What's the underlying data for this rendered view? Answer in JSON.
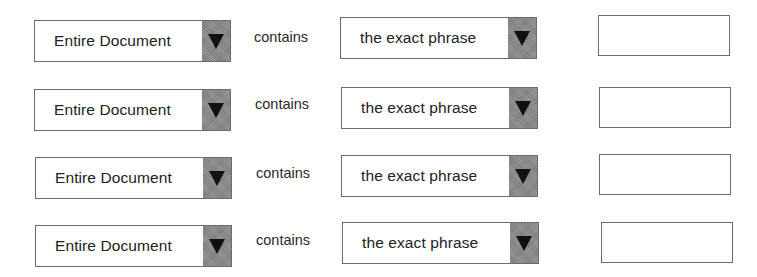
{
  "search_rows": [
    {
      "scope_select": {
        "value": "Entire Document",
        "icon": "dropdown-arrow-icon"
      },
      "operator_label": "contains",
      "match_select": {
        "value": "the exact phrase",
        "icon": "dropdown-arrow-icon"
      },
      "term_input": {
        "value": "",
        "placeholder": ""
      }
    },
    {
      "scope_select": {
        "value": "Entire Document",
        "icon": "dropdown-arrow-icon"
      },
      "operator_label": "contains",
      "match_select": {
        "value": "the exact phrase",
        "icon": "dropdown-arrow-icon"
      },
      "term_input": {
        "value": "",
        "placeholder": ""
      }
    },
    {
      "scope_select": {
        "value": "Entire Document",
        "icon": "dropdown-arrow-icon"
      },
      "operator_label": "contains",
      "match_select": {
        "value": "the exact phrase",
        "icon": "dropdown-arrow-icon"
      },
      "term_input": {
        "value": "",
        "placeholder": ""
      }
    },
    {
      "scope_select": {
        "value": "Entire Document",
        "icon": "dropdown-arrow-icon"
      },
      "operator_label": "contains",
      "match_select": {
        "value": "the exact phrase",
        "icon": "dropdown-arrow-icon"
      },
      "term_input": {
        "value": "",
        "placeholder": ""
      }
    }
  ],
  "colors": {
    "border": "#6b6b6b",
    "dropdown_button": "#8c8c8c",
    "arrow": "#111111",
    "text": "#222222"
  }
}
